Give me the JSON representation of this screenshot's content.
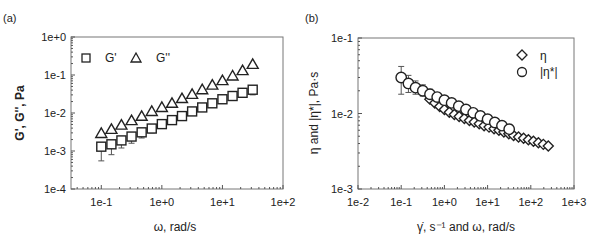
{
  "chart_data": [
    {
      "panel": "(a)",
      "type": "scatter",
      "xscale": "log",
      "yscale": "log",
      "xlabel": "ω, rad/s",
      "ylabel": "G', G'', Pa",
      "xlim": [
        0.03162,
        100
      ],
      "ylim": [
        0.0001,
        1
      ],
      "xticks": [
        "1e-1",
        "1e+0",
        "1e+1",
        "1e+2"
      ],
      "yticks": [
        "1e-4",
        "1e-3",
        "1e-2",
        "1e-1",
        "1e+0"
      ],
      "legend": [
        "G'",
        "G''"
      ],
      "legend_position": "upper left",
      "grid": false,
      "x": [
        0.1,
        0.147,
        0.215,
        0.316,
        0.464,
        0.681,
        1.0,
        1.47,
        2.15,
        3.16,
        4.64,
        6.81,
        10.0,
        14.7,
        21.5,
        31.6
      ],
      "series": [
        {
          "name": "G'",
          "marker": "square",
          "values": [
            0.0013,
            0.0015,
            0.0019,
            0.0024,
            0.0031,
            0.0039,
            0.0051,
            0.0065,
            0.0083,
            0.011,
            0.014,
            0.018,
            0.023,
            0.028,
            0.034,
            0.041
          ],
          "error_low": [
            0.00055,
            0.0008,
            0.0012,
            0.0016,
            0.0022,
            0.003,
            0.004,
            0.0055,
            0.0072,
            0.0098,
            0.0125,
            0.016,
            0.021,
            0.026,
            0.031,
            0.03
          ]
        },
        {
          "name": "G''",
          "marker": "triangle",
          "values": [
            0.0029,
            0.0037,
            0.0048,
            0.0063,
            0.0082,
            0.011,
            0.014,
            0.018,
            0.024,
            0.031,
            0.041,
            0.054,
            0.071,
            0.094,
            0.13,
            0.19
          ]
        }
      ]
    },
    {
      "panel": "(b)",
      "type": "scatter",
      "xscale": "log",
      "yscale": "log",
      "xlabel": "γ̇, s⁻¹ and ω, rad/s",
      "ylabel": "η and |η*|, Pa·s",
      "xlim": [
        0.01,
        1000
      ],
      "ylim": [
        0.001,
        0.1
      ],
      "xticks": [
        "1e-2",
        "1e-1",
        "1e+0",
        "1e+1",
        "1e+2",
        "1e+3"
      ],
      "yticks": [
        "1e-3",
        "1e-2",
        "1e-1"
      ],
      "legend": [
        "η",
        "|η*|"
      ],
      "legend_position": "upper right",
      "grid": false,
      "series": [
        {
          "name": "|η*|",
          "marker": "circle",
          "x": [
            0.1,
            0.147,
            0.215,
            0.316,
            0.464,
            0.681,
            1.0,
            1.47,
            2.15,
            3.16,
            4.64,
            6.81,
            10.0,
            14.7,
            21.5,
            31.6
          ],
          "values": [
            0.03,
            0.025,
            0.022,
            0.02,
            0.018,
            0.0165,
            0.015,
            0.0138,
            0.0125,
            0.0113,
            0.0102,
            0.0093,
            0.0084,
            0.0076,
            0.0069,
            0.0062
          ],
          "error_high": [
            0.042,
            0.032,
            0.027,
            0.024,
            0.021,
            0.019,
            0.017,
            0.015,
            0.0135,
            0.012,
            0.0108,
            0.0098,
            0.0088,
            0.008,
            0.0072,
            0.0065
          ],
          "error_low": [
            0.018,
            0.019,
            0.018,
            0.017,
            0.016,
            0.015,
            0.014,
            0.013,
            0.0118,
            0.0107,
            0.0097,
            0.0089,
            0.008,
            0.0072,
            0.0066,
            0.0059
          ]
        },
        {
          "name": "η",
          "marker": "diamond",
          "x": [
            0.46,
            0.6,
            0.78,
            1.0,
            1.3,
            1.7,
            2.2,
            2.9,
            3.8,
            4.9,
            6.4,
            8.3,
            10.8,
            14.1,
            18.3,
            23.8,
            31,
            40,
            52,
            68,
            88,
            115,
            150,
            195,
            254
          ],
          "values": [
            0.0155,
            0.0138,
            0.0124,
            0.0113,
            0.0104,
            0.0097,
            0.0091,
            0.0086,
            0.0081,
            0.0077,
            0.0073,
            0.0069,
            0.0066,
            0.0063,
            0.006,
            0.0057,
            0.0054,
            0.0051,
            0.0049,
            0.0047,
            0.0045,
            0.0043,
            0.0041,
            0.0039,
            0.0037
          ]
        }
      ]
    }
  ]
}
